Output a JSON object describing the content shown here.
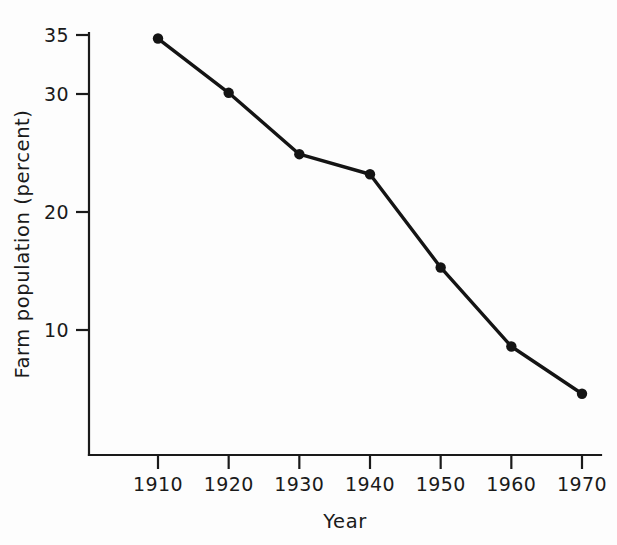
{
  "chart_data": {
    "type": "line",
    "title": "",
    "xlabel": "Year",
    "ylabel": "Farm population (percent)",
    "x": [
      1910,
      1920,
      1930,
      1940,
      1950,
      1960,
      1970
    ],
    "categories": [
      "1910",
      "1920",
      "1930",
      "1940",
      "1950",
      "1960",
      "1970"
    ],
    "values": [
      34.7,
      30.1,
      24.9,
      23.2,
      15.3,
      8.6,
      4.6
    ],
    "series": [
      {
        "name": "Farm population (percent)",
        "values": [
          34.7,
          30.1,
          24.9,
          23.2,
          15.3,
          8.6,
          4.6
        ]
      }
    ],
    "xlim": [
      1910,
      1970
    ],
    "ylim": [
      0,
      35
    ],
    "ytick_labels": [
      "35",
      "30",
      "20",
      "10"
    ],
    "ytick_values": [
      35,
      30,
      20,
      10
    ],
    "xtick_labels": [
      "1910",
      "1920",
      "1930",
      "1940",
      "1950",
      "1960",
      "1970"
    ],
    "grid": false,
    "legend": "none",
    "marker": "filled-circle",
    "line_color": "#141414",
    "marker_color": "#141414",
    "axis_color": "#1a1a1a",
    "background_color": "#fdfdfd"
  },
  "axes": {
    "x_title": "Year",
    "y_title": "Farm population (percent)"
  },
  "ticks": {
    "y": [
      {
        "label": "35",
        "value": 35
      },
      {
        "label": "30",
        "value": 30
      },
      {
        "label": "20",
        "value": 20
      },
      {
        "label": "10",
        "value": 10
      }
    ],
    "x": [
      {
        "label": "1910",
        "value": 1910
      },
      {
        "label": "1920",
        "value": 1920
      },
      {
        "label": "1930",
        "value": 1930
      },
      {
        "label": "1940",
        "value": 1940
      },
      {
        "label": "1950",
        "value": 1950
      },
      {
        "label": "1960",
        "value": 1960
      },
      {
        "label": "1970",
        "value": 1970
      }
    ]
  },
  "points": [
    {
      "label": "1910",
      "value": "34.7"
    },
    {
      "label": "1920",
      "value": "30.1"
    },
    {
      "label": "1930",
      "value": "24.9"
    },
    {
      "label": "1940",
      "value": "23.2"
    },
    {
      "label": "1950",
      "value": "15.3"
    },
    {
      "label": "1960",
      "value": "8.6"
    },
    {
      "label": "1970",
      "value": "4.6"
    }
  ]
}
